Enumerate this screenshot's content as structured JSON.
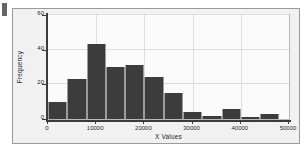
{
  "chart_data": {
    "type": "bar",
    "title": "",
    "xlabel": "X Values",
    "ylabel": "Frequency",
    "xlim": [
      0,
      50000
    ],
    "ylim": [
      0,
      60
    ],
    "grid": true,
    "legend": null,
    "bin_width": 4000,
    "bin_starts": [
      0,
      4000,
      8000,
      12000,
      16000,
      20000,
      24000,
      28000,
      32000,
      36000,
      40000,
      44000
    ],
    "categories": [
      "0-4000",
      "4000-8000",
      "8000-12000",
      "12000-16000",
      "16000-20000",
      "20000-24000",
      "24000-28000",
      "28000-32000",
      "32000-36000",
      "36000-40000",
      "40000-44000",
      "44000-48000"
    ],
    "values": [
      10,
      23,
      43,
      30,
      31,
      24,
      15,
      4,
      1.5,
      6,
      1,
      3
    ],
    "xticks": [
      0,
      10000,
      20000,
      30000,
      40000,
      50000
    ],
    "xtick_labels": [
      "0",
      "10000",
      "20000",
      "30000",
      "40000",
      "50000"
    ],
    "yticks": [
      0,
      20,
      40,
      60
    ],
    "ytick_labels": [
      "0",
      "20",
      "40",
      "60"
    ],
    "bar_color": "#3c3c3c",
    "bar_edge_color": "#9b9b9b",
    "grid_color": "#dedede",
    "axis_color": "#3b3b3b",
    "panel_background": "#f1f1f1",
    "plot_background": "#fbfbfb"
  }
}
